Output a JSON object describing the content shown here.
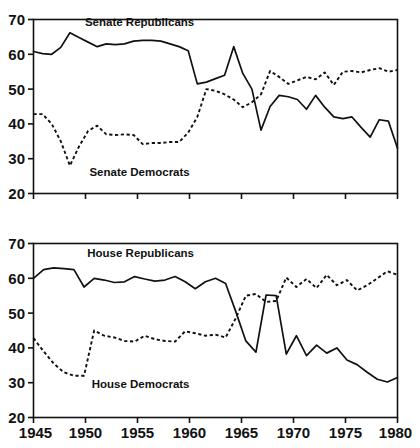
{
  "figure": {
    "title": "",
    "background": "#ffffff",
    "ink_color": "#111111"
  },
  "chart_data": [
    {
      "type": "line",
      "id": "senate",
      "title": "",
      "xlabel": "",
      "ylabel": "",
      "xlim": [
        1945,
        1980
      ],
      "ylim": [
        20,
        70
      ],
      "xticks": [
        1945,
        1950,
        1955,
        1960,
        1965,
        1970,
        1975,
        1980
      ],
      "xticklabels": [
        "",
        "",
        "",
        "",
        "",
        "",
        "",
        ""
      ],
      "yticks": [
        20,
        30,
        40,
        50,
        60,
        70
      ],
      "yticklabels": [
        "20",
        "30",
        "40",
        "50",
        "60",
        "70"
      ],
      "grid": false,
      "legend": "inline-annotations",
      "x": [
        1945,
        1946,
        1947,
        1948,
        1949,
        1950,
        1951,
        1952,
        1953,
        1954,
        1955,
        1956,
        1957,
        1958,
        1959,
        1960,
        1961,
        1962,
        1963,
        1964,
        1965,
        1966,
        1967,
        1968,
        1969,
        1970,
        1971,
        1972,
        1973,
        1974,
        1975,
        1976,
        1977,
        1978,
        1979,
        1980
      ],
      "series": [
        {
          "name": "Senate Republicans",
          "style": "solid",
          "annotation_x": 1955.2,
          "annotation_y": 68.2,
          "values": [
            60.8,
            60.2,
            60.0,
            62.0,
            66.2,
            64.8,
            63.5,
            62.2,
            63.0,
            62.8,
            63.0,
            63.8,
            64.0,
            64.0,
            63.8,
            63.0,
            62.2,
            61.0,
            51.5,
            52.0,
            53.0,
            54.0,
            62.2,
            54.5,
            50.0,
            38.2,
            45.0,
            48.2,
            47.8,
            47.0,
            44.2,
            48.2,
            44.8,
            42.0,
            41.5,
            42.0,
            39.0,
            36.2,
            41.2,
            40.8,
            33.0
          ]
        },
        {
          "name": "Senate Democrats",
          "style": "dashed",
          "annotation_x": 1955.2,
          "annotation_y": 25.0,
          "values": [
            42.8,
            42.8,
            40.0,
            35.0,
            28.0,
            33.5,
            38.0,
            39.5,
            37.0,
            36.8,
            37.0,
            36.8,
            34.2,
            34.5,
            34.5,
            34.8,
            34.8,
            37.5,
            42.0,
            50.0,
            49.5,
            48.5,
            47.0,
            44.8,
            46.2,
            48.5,
            55.2,
            53.5,
            51.5,
            52.5,
            53.5,
            52.8,
            54.8,
            51.2,
            55.0,
            55.2,
            54.8,
            55.5,
            56.0,
            55.0,
            55.5
          ]
        }
      ]
    },
    {
      "type": "line",
      "id": "house",
      "title": "",
      "xlabel": "",
      "ylabel": "",
      "xlim": [
        1945,
        1980
      ],
      "ylim": [
        20,
        70
      ],
      "xticks": [
        1945,
        1950,
        1955,
        1960,
        1965,
        1970,
        1975,
        1980
      ],
      "xticklabels": [
        "1945",
        "1950",
        "1955",
        "1960",
        "1965",
        "1970",
        "1975",
        "1980"
      ],
      "yticks": [
        20,
        30,
        40,
        50,
        60,
        70
      ],
      "yticklabels": [
        "20",
        "30",
        "40",
        "50",
        "60",
        "70"
      ],
      "grid": false,
      "legend": "inline-annotations",
      "x": [
        1945,
        1946,
        1947,
        1948,
        1949,
        1950,
        1951,
        1952,
        1953,
        1954,
        1955,
        1956,
        1957,
        1958,
        1959,
        1960,
        1961,
        1962,
        1963,
        1964,
        1965,
        1966,
        1967,
        1968,
        1969,
        1970,
        1971,
        1972,
        1973,
        1974,
        1975,
        1976,
        1977,
        1978,
        1979,
        1980
      ],
      "series": [
        {
          "name": "House Republicans",
          "style": "solid",
          "annotation_x": 1955.3,
          "annotation_y": 66.0,
          "values": [
            60.0,
            62.5,
            63.0,
            62.8,
            62.5,
            57.5,
            60.0,
            59.5,
            58.8,
            59.0,
            60.5,
            59.8,
            59.2,
            59.5,
            60.5,
            59.0,
            57.0,
            59.0,
            60.0,
            58.5,
            50.5,
            42.0,
            38.8,
            55.2,
            55.0,
            38.2,
            43.5,
            37.8,
            40.8,
            38.5,
            40.0,
            36.5,
            35.2,
            33.0,
            31.0,
            30.2,
            31.5
          ]
        },
        {
          "name": "House Democrats",
          "style": "dashed",
          "annotation_x": 1955.3,
          "annotation_y": 28.5,
          "values": [
            42.8,
            39.0,
            35.5,
            33.0,
            32.0,
            32.0,
            45.0,
            43.5,
            43.0,
            42.0,
            41.8,
            43.5,
            42.5,
            42.0,
            41.8,
            44.8,
            44.2,
            43.5,
            43.8,
            43.0,
            48.5,
            55.0,
            55.5,
            53.2,
            53.5,
            60.2,
            57.5,
            59.8,
            57.2,
            61.0,
            58.0,
            59.5,
            56.5,
            58.0,
            60.0,
            62.0,
            61.0
          ]
        }
      ]
    }
  ]
}
